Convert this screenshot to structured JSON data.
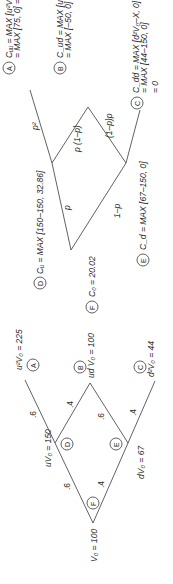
{
  "stock_tree": {
    "root": {
      "label": "V₀ = 100",
      "circle": "F"
    },
    "up": {
      "label": "uV₀ = 150",
      "circle": "D"
    },
    "down": {
      "label": "dV₀ = 67",
      "circle": "E"
    },
    "uu": {
      "label": "u²V₀ = 225",
      "circle": "A"
    },
    "ud": {
      "label": "ud V₀ = 100",
      "circle": "B"
    },
    "dd": {
      "label": "d²V₀ = 44",
      "circle": "C"
    },
    "probs": {
      "root_up": ".6",
      "root_down": ".4",
      "d_up": ".6",
      "d_down": ".4",
      "e_up": ".6",
      "e_down": ".4"
    }
  },
  "option_tree": {
    "root": {
      "label": "C₀ = 20.02",
      "circle": "F"
    },
    "d": {
      "label": "Cᵤ = MAX [150–150, 32.86]",
      "circle": "D"
    },
    "e": {
      "label": "C_d = MAX [67–150, 0]",
      "circle": "E"
    },
    "a": {
      "line1": "Cᵤᵤ = MAX [u²V₀–X, 0]",
      "line2": "= MAX [75, 0] = 75",
      "circle": "A"
    },
    "b": {
      "line1": "C_ud = MAX [udV₀–X, 0]",
      "line2": "= MAX [–50, 0] = 0",
      "circle": "B"
    },
    "c": {
      "line1": "C_dd = MAX [d²V₀–X, 0]",
      "line2": "= MAX [44–150, 0]",
      "line3": "= 0",
      "circle": "C"
    },
    "probs": {
      "p2": "p²",
      "p": "p",
      "one_minus_p": "1–p",
      "p_1mp": "p (1–p)",
      "one_mp_p": "(1–p)p"
    }
  }
}
